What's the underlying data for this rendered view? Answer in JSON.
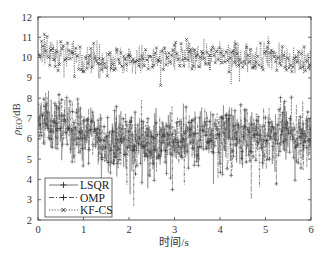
{
  "chart_data": {
    "type": "line",
    "title": "",
    "xlabel": "时间/s",
    "ylabel": "ρ_EO/dB",
    "ylabel_main": "ρ",
    "ylabel_sub": "EO",
    "ylabel_unit": "/dB",
    "xlim": [
      0,
      6
    ],
    "ylim": [
      2,
      12
    ],
    "xticks": [
      0,
      1,
      2,
      3,
      4,
      5,
      6
    ],
    "yticks": [
      2,
      3,
      4,
      5,
      6,
      7,
      8,
      9,
      10,
      11,
      12
    ],
    "grid": false,
    "legend_position": "lower left",
    "legend": [
      "LSQR",
      "OMP",
      "KF-CS"
    ],
    "series": [
      {
        "name": "LSQR",
        "style": "solid line, plus markers",
        "color": "#555555",
        "mean": 6.0,
        "spread": 1.0,
        "min": 2.6,
        "max": 8.6,
        "sample_x": [
          0.0,
          0.5,
          1.0,
          1.5,
          2.0,
          2.5,
          3.0,
          3.5,
          4.0,
          4.5,
          5.0,
          5.5,
          6.0
        ],
        "sample_y": [
          7.0,
          6.5,
          6.2,
          5.9,
          6.0,
          5.8,
          5.9,
          6.0,
          6.3,
          6.2,
          5.9,
          6.1,
          6.3
        ]
      },
      {
        "name": "OMP",
        "style": "dash-dot line, plus markers",
        "color": "#333333",
        "mean": 6.1,
        "spread": 1.0,
        "min": 2.7,
        "max": 8.5,
        "sample_x": [
          0.0,
          0.5,
          1.0,
          1.5,
          2.0,
          2.5,
          3.0,
          3.5,
          4.0,
          4.5,
          5.0,
          5.5,
          6.0
        ],
        "sample_y": [
          7.1,
          6.6,
          6.3,
          6.0,
          6.0,
          5.9,
          6.0,
          6.1,
          6.3,
          6.3,
          6.0,
          6.2,
          6.3
        ]
      },
      {
        "name": "KF-CS",
        "style": "dotted line, x markers",
        "color": "#111111",
        "mean": 10.0,
        "spread": 0.55,
        "min": 8.3,
        "max": 12.0,
        "sample_x": [
          0.0,
          0.5,
          1.0,
          1.5,
          2.0,
          2.5,
          3.0,
          3.5,
          4.0,
          4.5,
          5.0,
          5.5,
          6.0
        ],
        "sample_y": [
          10.3,
          10.2,
          10.1,
          10.0,
          9.8,
          9.9,
          10.0,
          10.1,
          10.1,
          10.0,
          10.2,
          9.9,
          9.8
        ]
      }
    ],
    "points_per_series": 600
  }
}
